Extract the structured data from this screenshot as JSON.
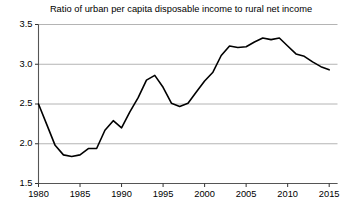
{
  "chart_data": {
    "type": "line",
    "title": "Ratio of urban per capita disposable income to rural net income",
    "xlabel": "",
    "ylabel": "",
    "xlim": [
      1980,
      2016
    ],
    "ylim": [
      1.5,
      3.5
    ],
    "xticks": [
      1980,
      1985,
      1990,
      1995,
      2000,
      2005,
      2010,
      2015
    ],
    "yticks": [
      1.5,
      2.0,
      2.5,
      3.0,
      3.5
    ],
    "ytick_labels": [
      "1.5",
      "2.0",
      "2.5",
      "3.0",
      "3.5"
    ],
    "xtick_labels": [
      "1980",
      "1985",
      "1990",
      "1995",
      "2000",
      "2005",
      "2010",
      "2015"
    ],
    "grid": "horizontal",
    "grid_color": "#b4b4b4",
    "line_color": "#000000",
    "line_width": 1.6,
    "legend": null,
    "x": [
      1980,
      1981,
      1982,
      1983,
      1984,
      1985,
      1986,
      1987,
      1988,
      1989,
      1990,
      1991,
      1992,
      1993,
      1994,
      1995,
      1996,
      1997,
      1998,
      1999,
      2000,
      2001,
      2002,
      2003,
      2004,
      2005,
      2006,
      2007,
      2008,
      2009,
      2010,
      2011,
      2012,
      2013,
      2014,
      2015
    ],
    "values": [
      2.5,
      2.24,
      1.98,
      1.86,
      1.84,
      1.86,
      1.94,
      1.94,
      2.17,
      2.29,
      2.2,
      2.4,
      2.58,
      2.8,
      2.86,
      2.71,
      2.51,
      2.47,
      2.51,
      2.65,
      2.79,
      2.9,
      3.11,
      3.23,
      3.21,
      3.22,
      3.28,
      3.33,
      3.31,
      3.33,
      3.23,
      3.13,
      3.1,
      3.03,
      2.97,
      2.93
    ]
  }
}
